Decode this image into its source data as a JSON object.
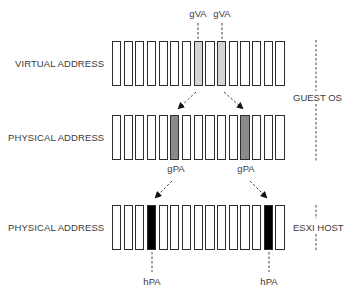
{
  "diagram": {
    "rows": [
      {
        "label": "VIRTUAL ADDRESS",
        "top": 41,
        "height": 45,
        "highlight_indices": [
          7,
          9
        ],
        "highlight_color": "#d4d4d4",
        "tags": [
          "gVA",
          "gVA"
        ],
        "tag_position": "above"
      },
      {
        "label": "PHYSICAL ADDRESS",
        "top": 115,
        "height": 45,
        "highlight_indices": [
          5,
          11
        ],
        "highlight_color": "#8a8a8a",
        "tags": [
          "gPA",
          "gPA"
        ],
        "tag_position": "below"
      },
      {
        "label": "PHYSICAL ADDRESS",
        "top": 205,
        "height": 45,
        "highlight_indices": [
          3,
          13
        ],
        "highlight_color": "#000000",
        "tags": [
          "hPA",
          "hPA"
        ],
        "tag_position": "below"
      }
    ],
    "cell_count": 15,
    "cell_start_x": 112,
    "cell_pitch": 11.67,
    "cell_width": 9.2,
    "side_labels": {
      "guest": "GUEST OS",
      "host": "ESXI HOST"
    },
    "mappings": [
      {
        "from": "gVA[7]",
        "to": "gPA[5]"
      },
      {
        "from": "gVA[9]",
        "to": "gPA[11]"
      },
      {
        "from": "gPA[5]",
        "to": "hPA[3]"
      },
      {
        "from": "gPA[11]",
        "to": "hPA[13]"
      }
    ]
  }
}
